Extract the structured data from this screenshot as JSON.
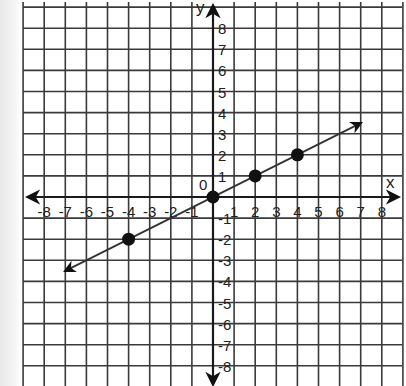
{
  "chart_data": {
    "type": "line",
    "title": "",
    "xlabel": "x",
    "ylabel": "y",
    "origin_label": "0",
    "xlim": [
      -9,
      9
    ],
    "ylim": [
      -9,
      9
    ],
    "grid": true,
    "x_ticks": [
      -8,
      -7,
      -6,
      -5,
      -4,
      -3,
      -2,
      -1,
      1,
      2,
      3,
      4,
      5,
      6,
      7,
      8
    ],
    "y_ticks": [
      8,
      7,
      6,
      5,
      4,
      3,
      2,
      1,
      -1,
      -2,
      -3,
      -4,
      -5,
      -6,
      -7,
      -8
    ],
    "series": [
      {
        "name": "line",
        "equation": "y = x/2",
        "line_endpoints": [
          [
            -7,
            -3.5
          ],
          [
            7,
            3.5
          ]
        ],
        "arrows": "both",
        "points": [
          [
            -4,
            -2
          ],
          [
            0,
            0
          ],
          [
            2,
            1
          ],
          [
            4,
            2
          ]
        ]
      }
    ]
  },
  "labels": {
    "x_axis": "x",
    "y_axis": "y",
    "origin": "0"
  },
  "colors": {
    "grid": "#3a3a3a",
    "axis": "#1a1a1a",
    "line": "#333333",
    "point": "#111111"
  }
}
